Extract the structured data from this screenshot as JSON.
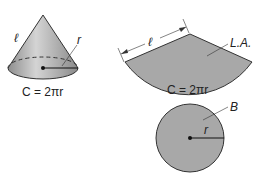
{
  "cone": {
    "slant_label": "ℓ",
    "radius_label": "r",
    "circumference_label": "C = 2πr"
  },
  "net": {
    "slant_label": "ℓ",
    "lateral_area_label": "L.A.",
    "circumference_label": "C = 2πr",
    "base_label": "B",
    "radius_label": "r"
  },
  "colors": {
    "fill": "#a8a8a8",
    "stroke": "#333333",
    "cone_light": "#d2d2d2",
    "cone_dark": "#8e8e8e"
  }
}
